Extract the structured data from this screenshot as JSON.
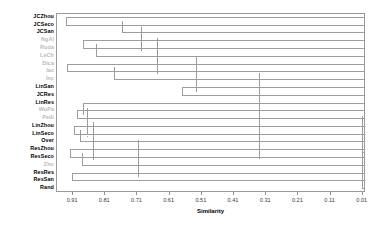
{
  "chart_data": {
    "type": "dendrogram",
    "title": "",
    "xlabel": "Similarity",
    "ylabel": "",
    "orientation": "horizontal",
    "xlim": [
      0.96,
      0.0
    ],
    "x_direction": "decreasing-left-to-right",
    "grid": false,
    "legend": null,
    "frame": true,
    "tick_labels": [
      "0.91",
      "0.81",
      "0.71",
      "0.61",
      "0.51",
      "0.41",
      "0.31",
      "0.21",
      "0.11",
      "0.01"
    ],
    "tick_values": [
      0.91,
      0.81,
      0.71,
      0.61,
      0.51,
      0.41,
      0.31,
      0.21,
      0.11,
      0.01
    ],
    "leaves": [
      {
        "label": "JCZhou",
        "tone": "dark"
      },
      {
        "label": "JCSeco",
        "tone": "dark"
      },
      {
        "label": "JCSan",
        "tone": "dark"
      },
      {
        "label": "NgAl",
        "tone": "light"
      },
      {
        "label": "Ruda",
        "tone": "light"
      },
      {
        "label": "LeCh",
        "tone": "light"
      },
      {
        "label": "Dica",
        "tone": "light"
      },
      {
        "label": "Iac",
        "tone": "light"
      },
      {
        "label": "Inc",
        "tone": "light"
      },
      {
        "label": "LinSan",
        "tone": "dark"
      },
      {
        "label": "JCRes",
        "tone": "dark"
      },
      {
        "label": "LinRes",
        "tone": "dark"
      },
      {
        "label": "WuPa",
        "tone": "light"
      },
      {
        "label": "Pedi",
        "tone": "light"
      },
      {
        "label": "LinZhou",
        "tone": "dark"
      },
      {
        "label": "LinSeco",
        "tone": "dark"
      },
      {
        "label": "Over",
        "tone": "dark"
      },
      {
        "label": "ResZhou",
        "tone": "dark"
      },
      {
        "label": "ResSeco",
        "tone": "dark"
      },
      {
        "label": "Zho",
        "tone": "light"
      },
      {
        "label": "ResRes",
        "tone": "dark"
      },
      {
        "label": "ResSan",
        "tone": "dark"
      },
      {
        "label": "Rand",
        "tone": "dark"
      }
    ],
    "merges": [
      {
        "children": [
          "JCZhou",
          "JCSeco"
        ],
        "similarity": 0.93
      },
      {
        "children": [
          "n0",
          "JCSan"
        ],
        "similarity": 0.755
      },
      {
        "children": [
          "NgAl",
          "Ruda"
        ],
        "similarity": 0.875
      },
      {
        "children": [
          "n2",
          "LeCh"
        ],
        "similarity": 0.835
      },
      {
        "children": [
          "n1",
          "n3"
        ],
        "similarity": 0.695
      },
      {
        "children": [
          "Dica",
          "Iac"
        ],
        "similarity": 0.925
      },
      {
        "children": [
          "n5",
          "Inc"
        ],
        "similarity": 0.78
      },
      {
        "children": [
          "n4",
          "n6"
        ],
        "similarity": 0.645
      },
      {
        "children": [
          "LinSan",
          "JCRes"
        ],
        "similarity": 0.57
      },
      {
        "children": [
          "n8",
          "n7"
        ],
        "similarity": 0.525
      },
      {
        "children": [
          "WuPa",
          "Pedi"
        ],
        "similarity": 0.895
      },
      {
        "children": [
          "LinRes",
          "n10"
        ],
        "similarity": 0.875
      },
      {
        "children": [
          "LinZhou",
          "LinSeco"
        ],
        "similarity": 0.905
      },
      {
        "children": [
          "n12",
          "Over"
        ],
        "similarity": 0.885
      },
      {
        "children": [
          "n11",
          "n13"
        ],
        "similarity": 0.865
      },
      {
        "children": [
          "ResZhou",
          "ResSeco"
        ],
        "similarity": 0.915
      },
      {
        "children": [
          "n15",
          "Zho"
        ],
        "similarity": 0.88
      },
      {
        "children": [
          "n14",
          "n16"
        ],
        "similarity": 0.845
      },
      {
        "children": [
          "ResRes",
          "ResSan"
        ],
        "similarity": 0.91
      },
      {
        "children": [
          "n17",
          "n18"
        ],
        "similarity": 0.705
      },
      {
        "children": [
          "n9",
          "n19"
        ],
        "similarity": 0.33
      },
      {
        "children": [
          "n20",
          "Rand"
        ],
        "similarity": 0.01
      }
    ],
    "colors": {
      "line": "#9d9d9d",
      "frame": "#9a9a9a",
      "label_dark": "#000000",
      "label_light": "#b9b9b9",
      "background": "#ffffff"
    }
  }
}
